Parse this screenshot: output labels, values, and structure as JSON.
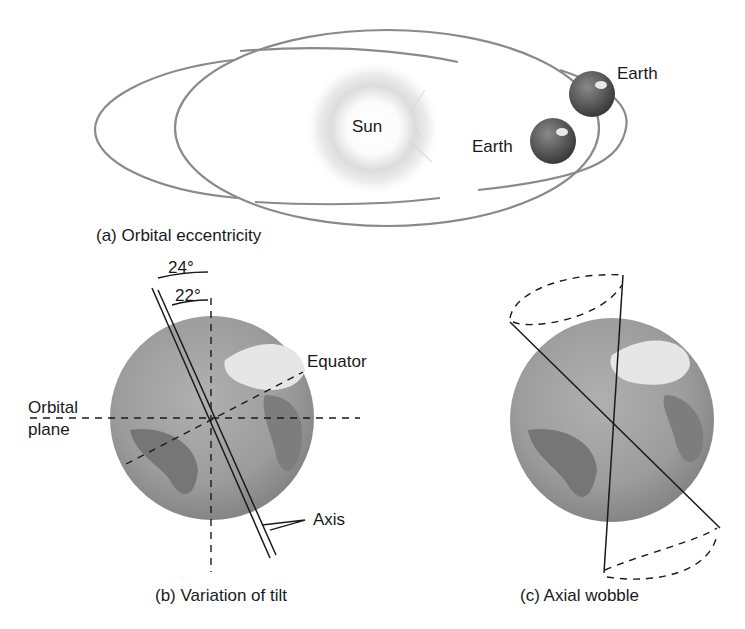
{
  "panel_a": {
    "caption": "(a) Orbital eccentricity",
    "sun_label": "Sun",
    "earth_label_outer": "Earth",
    "earth_label_inner": "Earth"
  },
  "panel_b": {
    "caption": "(b) Variation of tilt",
    "angle_max": "24°",
    "angle_min": "22°",
    "equator_label": "Equator",
    "orbital_plane_label_line1": "Orbital",
    "orbital_plane_label_line2": "plane",
    "axis_label": "Axis"
  },
  "panel_c": {
    "caption": "(c) Axial wobble"
  },
  "colors": {
    "orbit_line": "#8a8a8a",
    "globe_ocean": "#9a9a9a",
    "globe_land": "#6f6f6f",
    "ink": "#1a1a1a"
  }
}
